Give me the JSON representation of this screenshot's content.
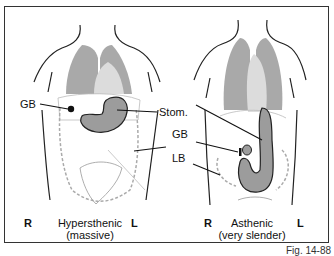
{
  "figure": {
    "number": "Fig. 14-88",
    "panels": [
      {
        "id": "hypersthenic",
        "caption_line1": "Hypersthenic",
        "caption_line2": "(massive)",
        "side_right": "R",
        "side_left": "L"
      },
      {
        "id": "asthenic",
        "caption_line1": "Asthenic",
        "caption_line2": "(very slender)",
        "side_right": "R",
        "side_left": "L"
      }
    ],
    "labels": {
      "gb_left": "GB",
      "stom": "Stom.",
      "gb_right": "GB",
      "lb": "LB"
    },
    "colors": {
      "lung": "#a9a9a9",
      "heart": "#dcdcdc",
      "stomach": "#9c9c9c",
      "outline": "#222222",
      "colon": "#bbbbbb",
      "frame": "#333333"
    }
  }
}
